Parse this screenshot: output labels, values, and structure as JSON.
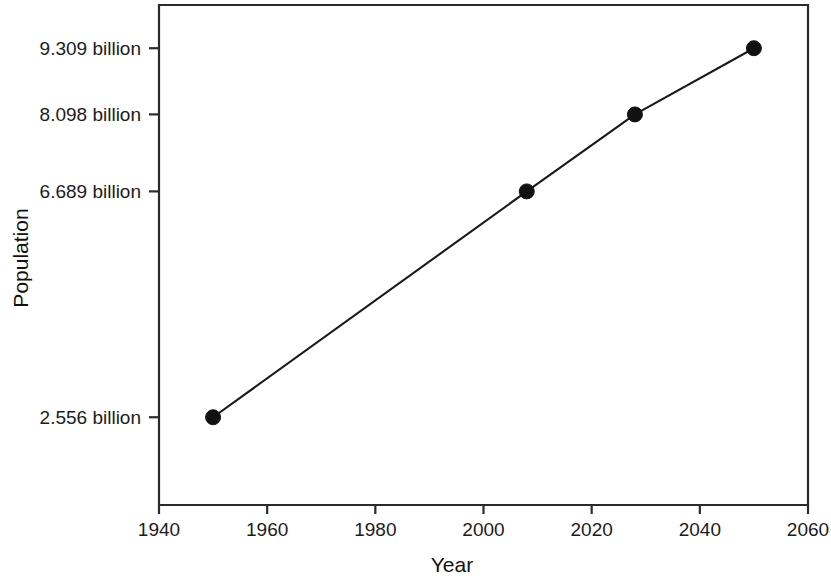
{
  "chart_data": {
    "type": "line",
    "title": "",
    "subtitle": "",
    "xlabel": "Year",
    "ylabel": "Population",
    "xlim": [
      1940,
      2060
    ],
    "ylim": [
      0.95,
      10.1
    ],
    "grid": false,
    "legend": null,
    "legend_position": "none",
    "x": [
      1950,
      2008,
      2028,
      2050
    ],
    "values": [
      2.556,
      6.689,
      8.098,
      9.309
    ],
    "point_labels": [
      "2.556 billion",
      "6.689 billion",
      "8.098 billion",
      "9.309 billion"
    ],
    "series": [
      {
        "name": "Population",
        "x": [
          1950,
          2008,
          2028,
          2050
        ],
        "values": [
          2.556,
          6.689,
          8.098,
          9.309
        ],
        "color": "#111111",
        "marker": "filled-circle"
      }
    ],
    "xticks": [
      {
        "value": 1940,
        "label": "1940"
      },
      {
        "value": 1960,
        "label": "1960"
      },
      {
        "value": 1980,
        "label": "1980"
      },
      {
        "value": 2000,
        "label": "2000"
      },
      {
        "value": 2020,
        "label": "2020"
      },
      {
        "value": 2040,
        "label": "2040"
      },
      {
        "value": 2060,
        "label": "2060"
      }
    ],
    "yticks": [
      {
        "value": 2.556,
        "label": "2.556 billion"
      },
      {
        "value": 6.689,
        "label": "6.689 billion"
      },
      {
        "value": 8.098,
        "label": "8.098 billion"
      },
      {
        "value": 9.309,
        "label": "9.309 billion"
      }
    ],
    "colors": {
      "background": "#ffffff",
      "axis": "#2b2b2b",
      "line": "#1a1a1a",
      "marker": "#111111",
      "text": "#1c1c1c"
    }
  }
}
